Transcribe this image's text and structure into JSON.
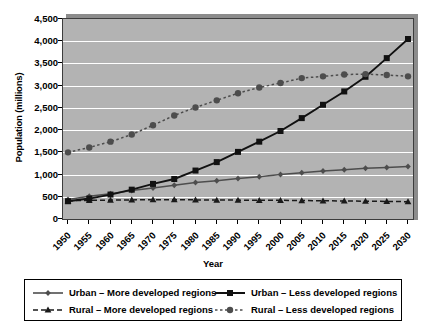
{
  "chart_data": {
    "type": "line",
    "title": "",
    "xlabel": "Year",
    "ylabel": "Population (millions)",
    "x": [
      1950,
      1955,
      1960,
      1965,
      1970,
      1975,
      1980,
      1985,
      1990,
      1995,
      2000,
      2005,
      2010,
      2015,
      2020,
      2025,
      2030
    ],
    "xticklabels": [
      "1950",
      "1955",
      "1960",
      "1965",
      "1970",
      "1975",
      "1980",
      "1985",
      "1990",
      "1995",
      "2000",
      "2005",
      "2010",
      "2015",
      "2020",
      "2025",
      "2030"
    ],
    "ylim": [
      0,
      4500
    ],
    "yticks": [
      0,
      500,
      1000,
      1500,
      2000,
      2500,
      3000,
      3500,
      4000,
      4500
    ],
    "yticklabels": [
      "0",
      "500",
      "1,000",
      "1,500",
      "2,000",
      "2,500",
      "3,000",
      "3,500",
      "4,000",
      "4,500"
    ],
    "grid": true,
    "grid_color": "#ffffff",
    "plot_background": "#b3b3b3",
    "legend_position": "bottom",
    "series": [
      {
        "name": "Urban – More developed regions",
        "marker": "diamond",
        "linestyle": "solid",
        "color": "#4d4d4d",
        "values": [
          440,
          510,
          570,
          640,
          700,
          760,
          820,
          860,
          910,
          950,
          1000,
          1040,
          1080,
          1110,
          1140,
          1160,
          1180
        ]
      },
      {
        "name": "Rural – More developed regions",
        "marker": "triangle",
        "linestyle": "dashed",
        "color": "#1a1a1a",
        "values": [
          410,
          420,
          425,
          430,
          435,
          435,
          430,
          425,
          425,
          420,
          420,
          415,
          410,
          405,
          400,
          395,
          390
        ]
      },
      {
        "name": "Urban – Less developed regions",
        "marker": "square",
        "linestyle": "solid",
        "color": "#111111",
        "values": [
          400,
          460,
          550,
          660,
          790,
          900,
          1090,
          1280,
          1510,
          1740,
          1980,
          2270,
          2570,
          2870,
          3200,
          3620,
          4050
        ]
      },
      {
        "name": "Rural – Less developed regions",
        "marker": "circle",
        "linestyle": "dotted",
        "color": "#4d4d4d",
        "values": [
          1500,
          1610,
          1740,
          1900,
          2110,
          2330,
          2510,
          2670,
          2830,
          2960,
          3060,
          3170,
          3210,
          3250,
          3260,
          3240,
          3210
        ]
      }
    ]
  },
  "legend": {
    "items": [
      "Urban – More developed regions",
      "Rural – More developed regions",
      "Urban – Less developed regions",
      "Rural – Less developed regions"
    ]
  }
}
